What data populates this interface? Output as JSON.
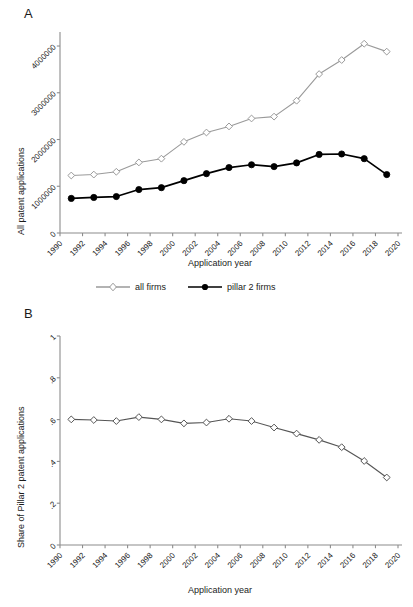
{
  "figure": {
    "background_color": "#ffffff",
    "series_colors": {
      "all_firms": "#9a9a9a",
      "pillar2_firms": "#000000"
    },
    "axis_color": "#8c8c8c",
    "text_color": "#1a1a1a"
  },
  "panel_a": {
    "letter": "A",
    "ylabel": "All patent applications",
    "xlabel": "Application year",
    "legend": [
      {
        "label": "all firms",
        "marker": "open-diamond",
        "color": "#9a9a9a"
      },
      {
        "label": "pillar 2 firms",
        "marker": "filled-circle",
        "color": "#000000"
      }
    ]
  },
  "panel_b": {
    "letter": "B",
    "ylabel": "Share of Pillar 2 patent applications",
    "xlabel": "Application year"
  },
  "chart_data": [
    {
      "type": "line",
      "panel": "A",
      "title": "",
      "xlabel": "Application year",
      "ylabel": "All patent applications",
      "xlim": [
        1990,
        2020
      ],
      "ylim": [
        0,
        4300000
      ],
      "xticks": [
        1990,
        1992,
        1994,
        1996,
        1998,
        2000,
        2002,
        2004,
        2006,
        2008,
        2010,
        2012,
        2014,
        2016,
        2018,
        2020
      ],
      "xtick_labels": [
        "1990",
        "1992",
        "1994",
        "1996",
        "1998",
        "2000",
        "2002",
        "2004",
        "2006",
        "2008",
        "2010",
        "2012",
        "2014",
        "2016",
        "2018",
        "2020"
      ],
      "yticks": [
        0,
        1000000,
        2000000,
        3000000,
        4000000
      ],
      "ytick_labels": [
        "0",
        "1000000",
        "2000000",
        "3000000",
        "4000000"
      ],
      "grid": false,
      "legend_position": "below",
      "x": [
        1991,
        1993,
        1995,
        1997,
        1999,
        2001,
        2003,
        2005,
        2007,
        2009,
        2011,
        2013,
        2015,
        2017,
        2019
      ],
      "series": [
        {
          "name": "all firms",
          "color": "#9a9a9a",
          "marker": "open-diamond",
          "values": [
            1230000,
            1250000,
            1310000,
            1510000,
            1590000,
            1950000,
            2150000,
            2280000,
            2450000,
            2490000,
            2830000,
            3400000,
            3700000,
            4050000,
            3880000
          ]
        },
        {
          "name": "pillar 2 firms",
          "color": "#000000",
          "marker": "filled-circle",
          "values": [
            740000,
            760000,
            780000,
            930000,
            970000,
            1120000,
            1270000,
            1400000,
            1460000,
            1420000,
            1500000,
            1680000,
            1690000,
            1590000,
            1250000
          ]
        }
      ]
    },
    {
      "type": "line",
      "panel": "B",
      "title": "",
      "xlabel": "Application year",
      "ylabel": "Share of Pillar 2 patent applications",
      "xlim": [
        1990,
        2020
      ],
      "ylim": [
        0,
        1
      ],
      "xticks": [
        1990,
        1992,
        1994,
        1996,
        1998,
        2000,
        2002,
        2004,
        2006,
        2008,
        2010,
        2012,
        2014,
        2016,
        2018,
        2020
      ],
      "xtick_labels": [
        "1990",
        "1992",
        "1994",
        "1996",
        "1998",
        "2000",
        "2002",
        "2004",
        "2006",
        "2008",
        "2010",
        "2012",
        "2014",
        "2016",
        "2018",
        "2020"
      ],
      "yticks": [
        0,
        0.2,
        0.4,
        0.6,
        0.8,
        1
      ],
      "ytick_labels": [
        "0",
        ".2",
        ".4",
        ".6",
        ".8",
        "1"
      ],
      "grid": false,
      "legend_position": "none",
      "x": [
        1991,
        1993,
        1995,
        1997,
        1999,
        2001,
        2003,
        2005,
        2007,
        2009,
        2011,
        2013,
        2015,
        2017,
        2019
      ],
      "series": [
        {
          "name": "Share of Pillar 2 patent applications",
          "color": "#555555",
          "marker": "open-diamond",
          "values": [
            0.601,
            0.598,
            0.593,
            0.612,
            0.601,
            0.582,
            0.586,
            0.604,
            0.593,
            0.562,
            0.533,
            0.503,
            0.468,
            0.402,
            0.323
          ]
        }
      ]
    }
  ]
}
